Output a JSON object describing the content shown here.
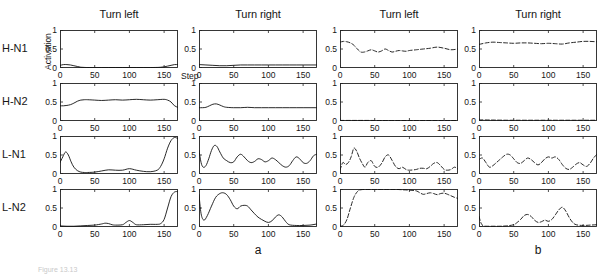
{
  "figure": {
    "row_labels": [
      "H-N1",
      "H-N2",
      "L-N1",
      "L-N2"
    ],
    "column_titles": [
      "Turn left",
      "Turn right",
      "Turn left",
      "Turn right"
    ],
    "group_labels": [
      "a",
      "b"
    ],
    "axis": {
      "y_label": "Activation",
      "x_label": "Step",
      "y_ticks": [
        "0",
        "0.5",
        "1"
      ],
      "x_ticks": [
        "0",
        "50",
        "100",
        "150"
      ],
      "y_min": 0,
      "y_max": 1,
      "x_min": 0,
      "x_max": 170
    },
    "caption_fragment": "Figure 13.13"
  },
  "chart_data": {
    "type": "line",
    "title": "",
    "xlabel": "Step",
    "ylabel": "Activation",
    "xlim": [
      0,
      170
    ],
    "ylim": [
      0,
      1
    ],
    "grid": false,
    "legend": "none",
    "panels": [
      {
        "row": "H-N1",
        "column_title": "Turn left",
        "group": "a",
        "linestyle": "solid",
        "x": [
          0,
          5,
          10,
          15,
          20,
          25,
          30,
          35,
          40,
          50,
          60,
          70,
          80,
          90,
          100,
          110,
          120,
          130,
          140,
          145,
          150,
          155,
          160,
          165,
          170
        ],
        "y": [
          0.07,
          0.09,
          0.09,
          0.08,
          0.06,
          0.04,
          0.02,
          0.015,
          0.012,
          0.01,
          0.01,
          0.012,
          0.012,
          0.012,
          0.012,
          0.012,
          0.012,
          0.012,
          0.015,
          0.02,
          0.03,
          0.05,
          0.07,
          0.09,
          0.09
        ]
      },
      {
        "row": "H-N2",
        "column_title": "Turn left",
        "group": "a",
        "linestyle": "solid",
        "x": [
          0,
          5,
          10,
          15,
          20,
          25,
          30,
          35,
          40,
          50,
          60,
          70,
          80,
          90,
          100,
          110,
          120,
          130,
          140,
          150,
          155,
          160,
          165,
          170
        ],
        "y": [
          0.4,
          0.4,
          0.41,
          0.43,
          0.47,
          0.52,
          0.55,
          0.56,
          0.56,
          0.55,
          0.54,
          0.55,
          0.56,
          0.55,
          0.56,
          0.57,
          0.56,
          0.55,
          0.56,
          0.57,
          0.55,
          0.5,
          0.4,
          0.36
        ]
      },
      {
        "row": "L-N1",
        "column_title": "Turn left",
        "group": "a",
        "linestyle": "solid",
        "x": [
          0,
          4,
          8,
          12,
          16,
          20,
          25,
          30,
          35,
          40,
          50,
          60,
          70,
          80,
          90,
          100,
          110,
          120,
          130,
          140,
          145,
          150,
          155,
          160,
          165,
          170
        ],
        "y": [
          0.3,
          0.45,
          0.58,
          0.5,
          0.32,
          0.18,
          0.09,
          0.05,
          0.04,
          0.04,
          0.05,
          0.08,
          0.11,
          0.1,
          0.1,
          0.14,
          0.1,
          0.07,
          0.06,
          0.1,
          0.2,
          0.4,
          0.68,
          0.88,
          0.96,
          0.93
        ]
      },
      {
        "row": "L-N2",
        "column_title": "Turn left",
        "group": "a",
        "linestyle": "solid",
        "x": [
          0,
          10,
          20,
          30,
          40,
          50,
          60,
          65,
          70,
          75,
          80,
          90,
          95,
          100,
          105,
          110,
          120,
          130,
          140,
          145,
          150,
          155,
          160,
          165,
          170
        ],
        "y": [
          0.03,
          0.02,
          0.02,
          0.03,
          0.04,
          0.05,
          0.08,
          0.1,
          0.09,
          0.06,
          0.05,
          0.06,
          0.12,
          0.17,
          0.12,
          0.06,
          0.06,
          0.07,
          0.07,
          0.09,
          0.2,
          0.5,
          0.8,
          0.92,
          0.93
        ]
      },
      {
        "row": "H-N1",
        "column_title": "Turn right",
        "group": "a",
        "linestyle": "solid",
        "x": [
          0,
          10,
          20,
          30,
          40,
          50,
          60,
          70,
          80,
          90,
          100,
          110,
          120,
          130,
          140,
          150,
          160,
          170
        ],
        "y": [
          0.09,
          0.08,
          0.07,
          0.06,
          0.06,
          0.07,
          0.08,
          0.08,
          0.08,
          0.08,
          0.08,
          0.08,
          0.08,
          0.08,
          0.08,
          0.08,
          0.08,
          0.08
        ]
      },
      {
        "row": "H-N2",
        "column_title": "Turn right",
        "group": "a",
        "linestyle": "solid",
        "x": [
          0,
          5,
          10,
          15,
          20,
          25,
          30,
          35,
          40,
          50,
          60,
          70,
          80,
          90,
          100,
          110,
          120,
          130,
          140,
          150,
          160,
          170
        ],
        "y": [
          0.35,
          0.35,
          0.36,
          0.4,
          0.44,
          0.45,
          0.42,
          0.38,
          0.36,
          0.35,
          0.35,
          0.36,
          0.35,
          0.35,
          0.35,
          0.35,
          0.35,
          0.35,
          0.35,
          0.35,
          0.35,
          0.35
        ]
      },
      {
        "row": "L-N1",
        "column_title": "Turn right",
        "group": "a",
        "linestyle": "solid",
        "x": [
          0,
          3,
          6,
          10,
          14,
          18,
          22,
          26,
          30,
          35,
          40,
          45,
          50,
          55,
          60,
          65,
          70,
          75,
          80,
          85,
          90,
          95,
          100,
          105,
          110,
          115,
          120,
          125,
          130,
          135,
          140,
          145,
          150,
          155,
          160,
          165,
          170
        ],
        "y": [
          0.62,
          0.3,
          0.18,
          0.22,
          0.4,
          0.62,
          0.75,
          0.72,
          0.58,
          0.42,
          0.35,
          0.3,
          0.32,
          0.45,
          0.52,
          0.45,
          0.35,
          0.3,
          0.33,
          0.4,
          0.38,
          0.32,
          0.35,
          0.42,
          0.38,
          0.3,
          0.22,
          0.18,
          0.22,
          0.35,
          0.45,
          0.4,
          0.3,
          0.28,
          0.35,
          0.48,
          0.52
        ]
      },
      {
        "row": "L-N2",
        "column_title": "Turn right",
        "group": "a",
        "linestyle": "solid",
        "x": [
          0,
          3,
          7,
          12,
          18,
          24,
          30,
          35,
          40,
          45,
          50,
          55,
          60,
          65,
          70,
          75,
          80,
          85,
          90,
          95,
          100,
          105,
          110,
          115,
          120,
          125,
          130,
          140,
          150,
          160,
          170
        ],
        "y": [
          0.85,
          0.35,
          0.18,
          0.3,
          0.55,
          0.78,
          0.88,
          0.9,
          0.85,
          0.72,
          0.55,
          0.48,
          0.55,
          0.57,
          0.55,
          0.45,
          0.35,
          0.26,
          0.2,
          0.15,
          0.12,
          0.16,
          0.26,
          0.32,
          0.26,
          0.14,
          0.06,
          0.04,
          0.04,
          0.05,
          0.08
        ]
      },
      {
        "row": "H-N1",
        "column_title": "Turn left",
        "group": "b",
        "linestyle": "dashed",
        "x": [
          0,
          5,
          10,
          15,
          20,
          25,
          30,
          35,
          40,
          45,
          50,
          55,
          60,
          65,
          70,
          75,
          80,
          85,
          90,
          95,
          100,
          110,
          120,
          130,
          140,
          150,
          160,
          170
        ],
        "y": [
          0.68,
          0.7,
          0.69,
          0.66,
          0.6,
          0.5,
          0.42,
          0.42,
          0.45,
          0.48,
          0.45,
          0.42,
          0.45,
          0.5,
          0.46,
          0.42,
          0.44,
          0.46,
          0.45,
          0.44,
          0.46,
          0.48,
          0.5,
          0.52,
          0.55,
          0.52,
          0.48,
          0.5
        ]
      },
      {
        "row": "H-N2",
        "column_title": "Turn left",
        "group": "b",
        "linestyle": "dashed",
        "x": [
          0,
          20,
          40,
          60,
          80,
          100,
          120,
          140,
          160,
          170
        ],
        "y": [
          0.015,
          0.015,
          0.015,
          0.012,
          0.012,
          0.012,
          0.012,
          0.012,
          0.012,
          0.012
        ]
      },
      {
        "row": "L-N1",
        "column_title": "Turn left",
        "group": "b",
        "linestyle": "dashed",
        "x": [
          0,
          4,
          8,
          12,
          16,
          20,
          24,
          28,
          32,
          36,
          40,
          45,
          50,
          55,
          60,
          65,
          70,
          75,
          80,
          85,
          90,
          95,
          100,
          110,
          115,
          120,
          125,
          130,
          135,
          140,
          145,
          150,
          155,
          160,
          165,
          170
        ],
        "y": [
          0.1,
          0.3,
          0.25,
          0.3,
          0.45,
          0.68,
          0.6,
          0.42,
          0.28,
          0.18,
          0.3,
          0.35,
          0.2,
          0.18,
          0.28,
          0.45,
          0.5,
          0.36,
          0.2,
          0.14,
          0.18,
          0.12,
          0.1,
          0.12,
          0.15,
          0.15,
          0.14,
          0.2,
          0.28,
          0.3,
          0.22,
          0.12,
          0.1,
          0.12,
          0.18,
          0.13
        ]
      },
      {
        "row": "L-N2",
        "column_title": "Turn left",
        "group": "b",
        "linestyle": "dashed",
        "x": [
          0,
          5,
          10,
          15,
          20,
          25,
          30,
          40,
          50,
          60,
          70,
          80,
          90,
          100,
          110,
          115,
          120,
          125,
          130,
          135,
          140,
          145,
          150,
          155,
          160,
          165,
          170
        ],
        "y": [
          0.02,
          0.05,
          0.2,
          0.5,
          0.78,
          0.93,
          0.98,
          0.99,
          0.99,
          0.99,
          0.99,
          0.99,
          0.98,
          0.97,
          0.95,
          0.9,
          0.86,
          0.88,
          0.9,
          0.88,
          0.85,
          0.88,
          0.89,
          0.86,
          0.82,
          0.78,
          0.75
        ]
      },
      {
        "row": "H-N1",
        "column_title": "Turn right",
        "group": "b",
        "linestyle": "dashed",
        "x": [
          0,
          10,
          20,
          30,
          40,
          50,
          60,
          70,
          80,
          90,
          100,
          110,
          120,
          130,
          140,
          150,
          160,
          170
        ],
        "y": [
          0.62,
          0.66,
          0.68,
          0.67,
          0.66,
          0.65,
          0.66,
          0.66,
          0.65,
          0.64,
          0.65,
          0.64,
          0.63,
          0.66,
          0.68,
          0.7,
          0.7,
          0.69
        ]
      },
      {
        "row": "H-N2",
        "column_title": "Turn right",
        "group": "b",
        "linestyle": "dashed",
        "x": [
          0,
          20,
          40,
          60,
          80,
          100,
          120,
          140,
          160,
          170
        ],
        "y": [
          0.03,
          0.025,
          0.02,
          0.02,
          0.02,
          0.02,
          0.02,
          0.02,
          0.02,
          0.02
        ]
      },
      {
        "row": "L-N1",
        "column_title": "Turn right",
        "group": "b",
        "linestyle": "dashed",
        "x": [
          0,
          5,
          10,
          15,
          20,
          25,
          30,
          35,
          40,
          45,
          50,
          55,
          60,
          65,
          70,
          75,
          80,
          85,
          90,
          95,
          100,
          105,
          110,
          115,
          120,
          125,
          130,
          135,
          140,
          145,
          150,
          155,
          160,
          165,
          170
        ],
        "y": [
          0.38,
          0.42,
          0.3,
          0.18,
          0.22,
          0.3,
          0.38,
          0.46,
          0.52,
          0.5,
          0.4,
          0.3,
          0.28,
          0.35,
          0.42,
          0.38,
          0.3,
          0.24,
          0.3,
          0.4,
          0.45,
          0.42,
          0.45,
          0.38,
          0.25,
          0.15,
          0.12,
          0.18,
          0.26,
          0.3,
          0.24,
          0.2,
          0.28,
          0.42,
          0.52
        ]
      },
      {
        "row": "L-N2",
        "column_title": "Turn right",
        "group": "b",
        "linestyle": "dashed",
        "x": [
          0,
          3,
          6,
          10,
          20,
          30,
          40,
          50,
          55,
          60,
          65,
          70,
          75,
          80,
          85,
          90,
          95,
          100,
          105,
          110,
          115,
          120,
          125,
          130,
          135,
          140,
          150,
          160,
          170
        ],
        "y": [
          0.28,
          0.1,
          0.03,
          0.02,
          0.02,
          0.02,
          0.03,
          0.06,
          0.12,
          0.2,
          0.3,
          0.33,
          0.28,
          0.18,
          0.12,
          0.14,
          0.18,
          0.15,
          0.2,
          0.32,
          0.45,
          0.52,
          0.42,
          0.25,
          0.12,
          0.06,
          0.04,
          0.05,
          0.06
        ]
      }
    ]
  }
}
